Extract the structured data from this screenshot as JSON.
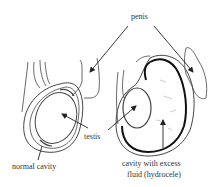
{
  "diagram": {
    "type": "anatomical-comparison",
    "labels": {
      "penis": "penis",
      "testis": "testis",
      "normal_cavity": "normal cavity",
      "hydrocele_line1": "cavity with excess",
      "hydrocele_line2": "fluid (hydrocele)"
    },
    "panels": [
      {
        "name": "normal",
        "description": "Normal scrotum with testis and normal cavity"
      },
      {
        "name": "hydrocele",
        "description": "Scrotum with testis and cavity with excess fluid"
      }
    ],
    "colors": {
      "line": "#333333",
      "background": "#ffffff"
    }
  }
}
